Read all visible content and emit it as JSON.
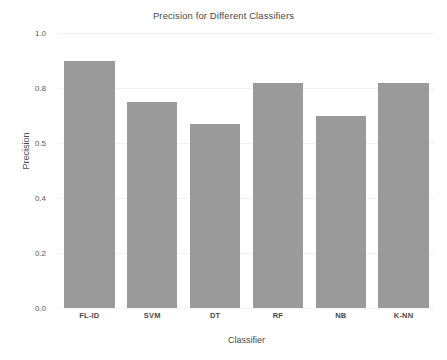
{
  "chart_data": {
    "type": "bar",
    "title": "Precision for Different Classifiers",
    "xlabel": "Classifier",
    "ylabel": "Precision",
    "categories": [
      "FL-ID",
      "SVM",
      "DT",
      "RF",
      "NB",
      "K-NN"
    ],
    "values": [
      0.9,
      0.75,
      0.67,
      0.82,
      0.7,
      0.82
    ],
    "ytick_labels": [
      "1.0",
      "0.8",
      "0.5",
      "0.4",
      "0.2",
      "0.0"
    ],
    "ytick_positions": [
      1.0,
      0.8,
      0.6,
      0.4,
      0.2,
      0.0
    ],
    "ylim": [
      0.0,
      1.0
    ],
    "grid": true,
    "legend": "none",
    "bar_color": "#9a9a9a",
    "background_color": "#ffffff",
    "grid_color": "#f2f2f2",
    "text_color": "#4a4a4a"
  }
}
